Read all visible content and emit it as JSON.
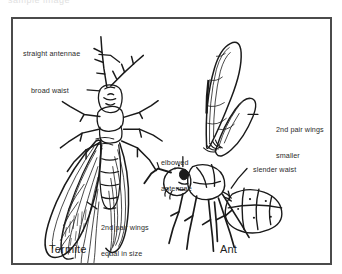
{
  "page": {
    "background_color": "#ffffff",
    "top_cut_off_text": "sample image"
  },
  "frame": {
    "border_color": "#4b4b4b",
    "fill_color": "#ffffff"
  },
  "diagram": {
    "type": "labeled-illustration",
    "ink_color": "#1a1a1a",
    "specimens": [
      {
        "name": "termite",
        "caption": "Termite",
        "view": "dorsal",
        "labels": [
          {
            "id": "straight-antennae",
            "text": "straight antennae",
            "lines": [
              "straight antennae"
            ],
            "side": "left",
            "leader": true
          },
          {
            "id": "broad-waist",
            "text": "broad waist",
            "lines": [
              "broad waist"
            ],
            "side": "left",
            "leader": true
          },
          {
            "id": "termite-second-pair-wings",
            "text": "2nd pair wings equal in size",
            "lines": [
              "2nd pair wings",
              "equal in size"
            ],
            "side": "right",
            "leader": true
          }
        ]
      },
      {
        "name": "ant",
        "caption": "Ant",
        "view": "lateral",
        "labels": [
          {
            "id": "elbowed-antennae",
            "text": "elbowed antennae",
            "lines": [
              "elbowed",
              "antennae"
            ],
            "side": "left",
            "leader": true
          },
          {
            "id": "ant-second-pair-wings",
            "text": "2nd pair wings smaller",
            "lines": [
              "2nd pair wings",
              "smaller"
            ],
            "side": "right",
            "leader": true
          },
          {
            "id": "slender-waist",
            "text": "slender waist",
            "lines": [
              "slender waist"
            ],
            "side": "right",
            "leader": true
          }
        ]
      }
    ]
  },
  "labels": {
    "straight_antennae": "straight antennae",
    "broad_waist": "broad waist",
    "termite_wings_l1": "2nd pair wings",
    "termite_wings_l2": "equal in size",
    "elbowed_l1": "elbowed",
    "elbowed_l2": "antennae",
    "ant_wings_l1": "2nd pair wings",
    "ant_wings_l2": "smaller",
    "slender_waist": "slender waist"
  },
  "captions": {
    "termite": "Termite",
    "ant": "Ant"
  }
}
